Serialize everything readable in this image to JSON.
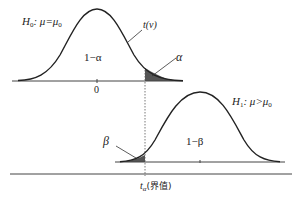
{
  "diagram": {
    "type": "hypothesis-test-power",
    "null_distribution": {
      "hypothesis_label": "H",
      "hypothesis_sub": "0",
      "hypothesis_rel": ": μ=μ",
      "hypothesis_rel_sub": "0",
      "curve_label": "t(ν)",
      "center_label": "1−α",
      "tail_label": "α",
      "tick_label": "0"
    },
    "alt_distribution": {
      "hypothesis_label": "H",
      "hypothesis_sub": "1",
      "hypothesis_rel": ": μ>μ",
      "hypothesis_rel_sub": "0",
      "center_label": "1−β",
      "tail_label": "β"
    },
    "critical_value": {
      "symbol": "t",
      "symbol_sub": "α",
      "annotation": "(界值)"
    },
    "colors": {
      "curve": "#222222",
      "axis": "#444444",
      "shade": "#555555",
      "dashed": "#555555"
    }
  }
}
